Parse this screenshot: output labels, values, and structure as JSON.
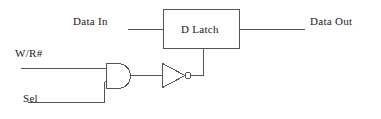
{
  "diagram": {
    "type": "digital-logic-schematic",
    "stroke_color": "#555555",
    "text_color": "#1a1a1a",
    "background_color": "#ffffff",
    "labels": {
      "data_in": "Data In",
      "data_out": "Data Out",
      "write_read": "W/R#",
      "sel": "Sel",
      "d_latch": "D Latch"
    },
    "components": [
      {
        "name": "d-latch",
        "kind": "block",
        "label": "D Latch",
        "x": 163,
        "y": 9,
        "width": 77,
        "height": 40
      },
      {
        "name": "and-gate",
        "kind": "and",
        "inputs": [
          "W/R#",
          "Sel"
        ],
        "x": 106,
        "y": 63,
        "width": 24,
        "height": 25
      },
      {
        "name": "inverter",
        "kind": "not",
        "x": 162,
        "y": 63,
        "width": 23,
        "height": 24,
        "bubble_radius": 3
      }
    ],
    "nets": [
      {
        "name": "data-in-wire",
        "from": "Data In",
        "to": "d-latch.D"
      },
      {
        "name": "data-out-wire",
        "from": "d-latch.Q",
        "to": "Data Out"
      },
      {
        "name": "wr-wire",
        "from": "W/R#",
        "to": "and-gate.in0"
      },
      {
        "name": "sel-wire",
        "from": "Sel",
        "to": "and-gate.in1"
      },
      {
        "name": "and-to-inverter",
        "from": "and-gate.out",
        "to": "inverter.in"
      },
      {
        "name": "inverter-to-enable",
        "from": "inverter.out",
        "to": "d-latch.enable"
      }
    ]
  }
}
